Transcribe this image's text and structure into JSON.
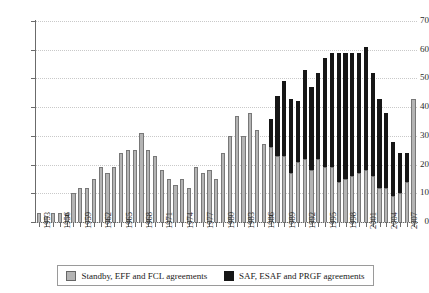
{
  "chart_data": {
    "type": "bar",
    "subtype": "stacked-vertical",
    "title": "",
    "subtitle": "",
    "xlabel": "",
    "ylabel": "",
    "ylim": [
      0,
      70
    ],
    "ytick_step": 10,
    "yticks": [
      0,
      10,
      20,
      30,
      40,
      50,
      60,
      70
    ],
    "grid": "horizontal-dotted",
    "legend_position": "bottom",
    "x_tick_label_interval": 3,
    "x_tick_labels": [
      "1953",
      "1956",
      "1959",
      "1962",
      "1965",
      "1968",
      "1971",
      "1974",
      "1977",
      "1980",
      "1983",
      "1986",
      "1989",
      "1992",
      "1995",
      "1998",
      "2001",
      "2004",
      "2007"
    ],
    "categories": [
      1953,
      1954,
      1955,
      1956,
      1957,
      1958,
      1959,
      1960,
      1961,
      1962,
      1963,
      1964,
      1965,
      1966,
      1967,
      1968,
      1969,
      1970,
      1971,
      1972,
      1973,
      1974,
      1975,
      1976,
      1977,
      1978,
      1979,
      1980,
      1981,
      1982,
      1983,
      1984,
      1985,
      1986,
      1987,
      1988,
      1989,
      1990,
      1991,
      1992,
      1993,
      1994,
      1995,
      1996,
      1997,
      1998,
      1999,
      2000,
      2001,
      2002,
      2003,
      2004,
      2005,
      2006,
      2007,
      2008
    ],
    "series": [
      {
        "name": "Standby, EFF and FCL agreements",
        "color": "#b4b4b4",
        "values": [
          3,
          2,
          3,
          3,
          3,
          10,
          12,
          12,
          15,
          19,
          17,
          19,
          24,
          25,
          25,
          31,
          25,
          23,
          18,
          15,
          13,
          15,
          12,
          19,
          17,
          18,
          15,
          24,
          30,
          37,
          30,
          38,
          32,
          27,
          26,
          23,
          23,
          17,
          21,
          22,
          18,
          22,
          19,
          19,
          14,
          15,
          16,
          17,
          18,
          16,
          12,
          12,
          9,
          10,
          14,
          43
        ]
      },
      {
        "name": "SAF, ESAF and PRGF agreements",
        "color": "#161616",
        "values": [
          0,
          0,
          0,
          0,
          0,
          0,
          0,
          0,
          0,
          0,
          0,
          0,
          0,
          0,
          0,
          0,
          0,
          0,
          0,
          0,
          0,
          0,
          0,
          0,
          0,
          0,
          0,
          0,
          0,
          0,
          0,
          0,
          0,
          0,
          10,
          21,
          26,
          26,
          21,
          31,
          29,
          30,
          38,
          40,
          45,
          44,
          43,
          42,
          43,
          36,
          31,
          26,
          19,
          14,
          10,
          0
        ]
      }
    ],
    "totals": [
      3,
      2,
      3,
      3,
      3,
      10,
      12,
      12,
      15,
      19,
      17,
      19,
      24,
      25,
      25,
      31,
      25,
      23,
      18,
      15,
      13,
      15,
      12,
      19,
      17,
      18,
      15,
      24,
      30,
      37,
      30,
      38,
      32,
      27,
      36,
      44,
      49,
      43,
      42,
      53,
      47,
      52,
      57,
      59,
      59,
      59,
      59,
      59,
      61,
      52,
      43,
      38,
      28,
      24,
      24,
      43
    ]
  },
  "legend": {
    "items": [
      {
        "label": "Standby, EFF and FCL agreements",
        "swatch": "gray"
      },
      {
        "label": "SAF, ESAF and PRGF agreements",
        "swatch": "black"
      }
    ]
  }
}
